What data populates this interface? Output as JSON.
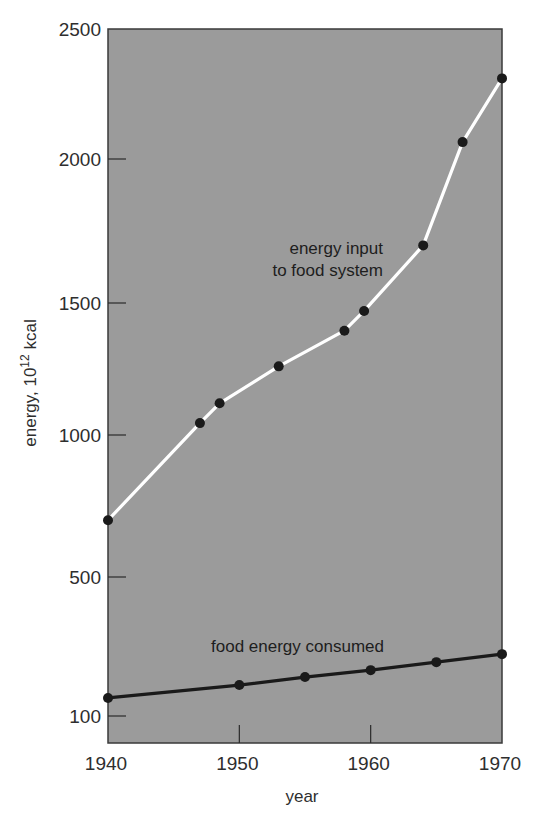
{
  "chart_data": {
    "type": "line",
    "title": "",
    "xlabel": "year",
    "ylabel": "energy, 10^12 kcal",
    "ylabel_parts": {
      "base": "energy, 10",
      "sup": "12",
      "unit": " kcal"
    },
    "xlim": [
      1940,
      1970
    ],
    "ylim": [
      0,
      2500
    ],
    "x_ticks": [
      1940,
      1950,
      1960,
      1970
    ],
    "y_ticks": [
      100,
      500,
      1000,
      1500,
      2000,
      2500
    ],
    "grid": false,
    "legend": "none (direct labels)",
    "background_color": "#9b9b9b",
    "series": [
      {
        "name": "energy input to food system",
        "label_lines": [
          "energy input",
          "to food system"
        ],
        "line_color": "#ffffff",
        "marker_color": "#1a1a1a",
        "x": [
          1940,
          1947,
          1948.5,
          1953,
          1958,
          1959.5,
          1964,
          1967,
          1970
        ],
        "values": [
          700,
          1045,
          1120,
          1260,
          1395,
          1470,
          1700,
          2065,
          2310
        ]
      },
      {
        "name": "food energy consumed",
        "label_lines": [
          "food energy consumed"
        ],
        "line_color": "#1a1a1a",
        "marker_color": "#1a1a1a",
        "x": [
          1940,
          1950,
          1955,
          1960,
          1965,
          1970
        ],
        "values": [
          152,
          189,
          212,
          232,
          255,
          278
        ]
      }
    ]
  }
}
